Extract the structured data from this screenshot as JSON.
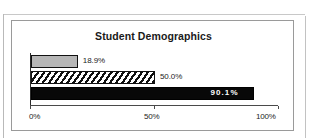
{
  "chart_data": {
    "type": "bar",
    "orientation": "horizontal",
    "title": "Student Demographics",
    "xlabel": "",
    "ylabel": "",
    "xlim": [
      0,
      100
    ],
    "grid": false,
    "legend": "none",
    "tick_labels": [
      "0%",
      "50%",
      "100%"
    ],
    "tick_values": [
      0,
      50,
      100
    ],
    "categories": [
      "",
      "",
      ""
    ],
    "values": [
      18.9,
      50.0,
      90.1
    ],
    "data_labels": [
      "18.9%",
      "50.0%",
      "90.1%"
    ],
    "series": [
      {
        "name": "bar-1",
        "value": 18.9,
        "label": "18.9%",
        "fill": "gray",
        "label_position": "outside"
      },
      {
        "name": "bar-2",
        "value": 50.0,
        "label": "50.0%",
        "fill": "diagonal-hatch",
        "label_position": "outside"
      },
      {
        "name": "bar-3",
        "value": 90.1,
        "label": "90.1%",
        "fill": "solid-black",
        "label_position": "inside"
      }
    ],
    "colors": {
      "bar_gray": "#b6b6b6",
      "bar_hatch_line": "#101010",
      "bar_solid": "#080808",
      "axis": "#2b2b2b",
      "text": "#1c1c1c",
      "inside_label": "#ffffff",
      "frame": "#9a9a9a"
    }
  }
}
